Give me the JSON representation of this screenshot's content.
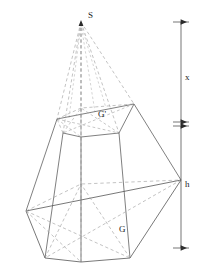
{
  "figure": {
    "type": "geometric-solid-diagram",
    "canvas": {
      "width": 212,
      "height": 278
    },
    "colors": {
      "stroke_solid": "#555555",
      "stroke_hidden": "#9a9a9a",
      "dimension": "#3a3a3a",
      "text": "#1a1a1a",
      "background": "#ffffff"
    },
    "labels": {
      "apex": "S",
      "top_base": "G'",
      "bottom_base": "G",
      "upper_height": "x",
      "lower_height": "h"
    },
    "geometry": {
      "apex": {
        "x": 81,
        "y": 22
      },
      "top_hexagon": [
        {
          "x": 57,
          "y": 119
        },
        {
          "x": 81,
          "y": 108
        },
        {
          "x": 134,
          "y": 104
        },
        {
          "x": 119,
          "y": 133
        },
        {
          "x": 81,
          "y": 137
        },
        {
          "x": 63,
          "y": 133
        }
      ],
      "bottom_hexagon": [
        {
          "x": 26,
          "y": 211
        },
        {
          "x": 81,
          "y": 184
        },
        {
          "x": 181,
          "y": 180
        },
        {
          "x": 130,
          "y": 258
        },
        {
          "x": 81,
          "y": 262
        },
        {
          "x": 45,
          "y": 258
        }
      ],
      "top_face_center": {
        "x": 81,
        "y": 120
      },
      "bottom_face_center": {
        "x": 81,
        "y": 222
      }
    },
    "dimension_lines": {
      "axis_x_px": 181,
      "upper": {
        "from_y": 22,
        "to_y": 122,
        "label": "x"
      },
      "lower": {
        "from_y": 126,
        "to_y": 248,
        "label": "h"
      }
    }
  }
}
